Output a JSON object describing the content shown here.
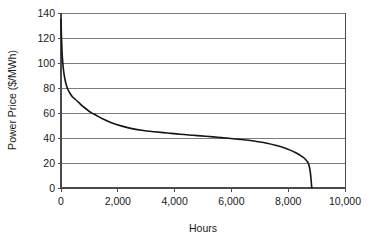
{
  "chart_data": {
    "type": "line",
    "title": "",
    "subtitle": "",
    "xlabel": "Hours",
    "ylabel": "Power Price ($/MWh)",
    "xlim": [
      0,
      10000
    ],
    "ylim": [
      0,
      140
    ],
    "grid": "horizontal",
    "legend": "none",
    "xticks": [
      0,
      2000,
      4000,
      6000,
      8000,
      10000
    ],
    "xtick_labels": [
      "0",
      "2,000",
      "4,000",
      "6,000",
      "8,000",
      "10,000"
    ],
    "yticks": [
      0,
      20,
      40,
      60,
      80,
      100,
      120,
      140
    ],
    "ytick_labels": [
      "0",
      "20",
      "40",
      "60",
      "80",
      "100",
      "120",
      "140"
    ],
    "series": [
      {
        "name": "Power price duration curve",
        "color": "#151515",
        "x": [
          0,
          15,
          35,
          60,
          90,
          130,
          180,
          240,
          310,
          400,
          500,
          620,
          760,
          900,
          1050,
          1250,
          1500,
          1800,
          2150,
          2500,
          2900,
          3300,
          3750,
          4200,
          4650,
          5100,
          5500,
          5900,
          6250,
          6600,
          6950,
          7250,
          7550,
          7800,
          8050,
          8250,
          8420,
          8560,
          8660,
          8720,
          8770,
          8800,
          8830
        ],
        "y": [
          135,
          122,
          110,
          101,
          94,
          88,
          83,
          79,
          76,
          73,
          71,
          68.5,
          65.5,
          63,
          60.5,
          58,
          55,
          52,
          49.5,
          47.5,
          46,
          45,
          44,
          43,
          42.2,
          41.4,
          40.6,
          39.8,
          39,
          38.2,
          37,
          35.8,
          34.2,
          32.6,
          30.5,
          28.4,
          26.2,
          24,
          21.5,
          19,
          14,
          8,
          0
        ]
      }
    ]
  },
  "axes": {
    "y_axis_title": "Power Price ($/MWh)",
    "x_axis_title": "Hours"
  }
}
